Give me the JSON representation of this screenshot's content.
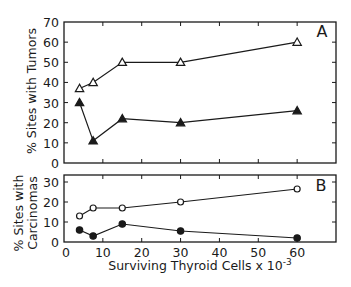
{
  "chart_data": [
    {
      "type": "line",
      "panel_label": "A",
      "title": "",
      "xlabel": "Surviving Thyroid Cells x 10^-3",
      "ylabel": "% Sites with Tumors",
      "xlim": [
        0,
        70
      ],
      "ylim": [
        0,
        70
      ],
      "yticks": [
        0,
        10,
        20,
        30,
        40,
        50,
        60,
        70
      ],
      "xticks": [
        0,
        10,
        20,
        30,
        40,
        50,
        60
      ],
      "x": [
        4,
        7.5,
        15,
        30,
        60
      ],
      "series": [
        {
          "name": "open-triangles",
          "marker": "open-triangle",
          "values": [
            37,
            40,
            50,
            50,
            60
          ]
        },
        {
          "name": "filled-triangles",
          "marker": "filled-triangle",
          "values": [
            30,
            11,
            22,
            20,
            26
          ]
        }
      ],
      "grid": false,
      "legend": "none"
    },
    {
      "type": "line",
      "panel_label": "B",
      "title": "",
      "xlabel": "Surviving Thyroid Cells x 10^-3",
      "ylabel": "% Sites with Carcinomas",
      "xlim": [
        0,
        70
      ],
      "ylim": [
        0,
        33.5
      ],
      "yticks": [
        0,
        10,
        20,
        30
      ],
      "xticks": [
        0,
        10,
        20,
        30,
        40,
        50,
        60
      ],
      "x": [
        4,
        7.5,
        15,
        30,
        60
      ],
      "series": [
        {
          "name": "open-circles",
          "marker": "open-circle",
          "values": [
            13,
            17,
            17,
            20,
            26.5
          ]
        },
        {
          "name": "filled-circles",
          "marker": "filled-circle",
          "values": [
            6,
            3,
            9,
            5.5,
            2
          ]
        }
      ],
      "grid": false,
      "legend": "none"
    }
  ],
  "labels": {
    "panel_a": "A",
    "panel_b": "B",
    "ylabel_a": "% Sites with Tumors",
    "ylabel_b_line1": "% Sites with",
    "ylabel_b_line2": "Carcinomas",
    "xlabel_main": "Surviving Thyroid Cells x 10",
    "xlabel_exp": "-3"
  },
  "colors": {
    "ink": "#1a1a1a",
    "background": "#ffffff"
  }
}
